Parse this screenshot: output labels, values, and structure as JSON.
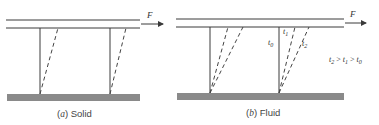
{
  "figure": {
    "panels": [
      {
        "id": "a",
        "caption_letter": "a",
        "caption_text": "Solid",
        "force_label": "F",
        "time_labels": []
      },
      {
        "id": "b",
        "caption_letter": "b",
        "caption_text": "Fluid",
        "force_label": "F",
        "time_labels": {
          "t0": {
            "base": "t",
            "sub": "0"
          },
          "t1": {
            "base": "t",
            "sub": "1"
          },
          "t2": {
            "base": "t",
            "sub": "2"
          }
        },
        "relation": {
          "a_base": "t",
          "a_sub": "2",
          "op1": ">",
          "b_base": "t",
          "b_sub": "1",
          "op2": ">",
          "c_base": "t",
          "c_sub": "0"
        }
      }
    ],
    "colors": {
      "line": "#3a3a3a",
      "ground": "#8a8a8a",
      "dashed": "#444444"
    }
  }
}
